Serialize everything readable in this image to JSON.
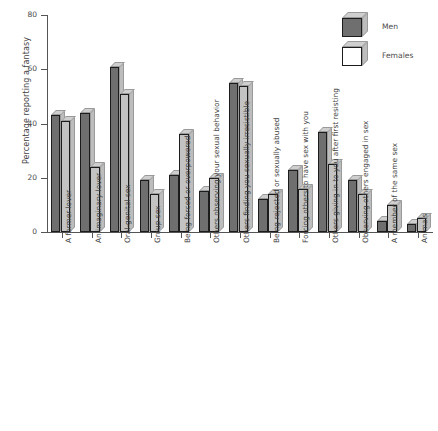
{
  "chart_data": {
    "type": "bar",
    "title": "",
    "xlabel": "",
    "ylabel": "Percentage reporting a fantasy",
    "ylim": [
      0,
      80
    ],
    "yticks": [
      0,
      20,
      40,
      60,
      80
    ],
    "grid": false,
    "legend_position": "top-right",
    "categories": [
      "A former lover",
      "An imaginary lover",
      "Oral-genital sex",
      "Group sex",
      "Being forced or overpowered",
      "Others observing your sexual behavior",
      "Others finding you sexually irresistible",
      "Being rejected or sexually abused",
      "Forcing others to have sex with you",
      "Others giving in to you after first resisting",
      "Observing others engaged in sex",
      "A member of the same sex",
      "Animals"
    ],
    "series": [
      {
        "name": "Men",
        "color": "#6f6f6f",
        "values": [
          43,
          44,
          61,
          19,
          21,
          15,
          55,
          12,
          23,
          37,
          19,
          4,
          3
        ]
      },
      {
        "name": "Females",
        "color": "#c3c3c3",
        "values": [
          41,
          24,
          51,
          14,
          36,
          20,
          54,
          14,
          16,
          25,
          14,
          10,
          5
        ]
      }
    ]
  },
  "legend": {
    "items": [
      {
        "label": "Men"
      },
      {
        "label": "Females"
      }
    ]
  },
  "axis": {
    "y_label": "Percentage reporting a fantasy",
    "y_tick_labels": [
      "0",
      "20",
      "40",
      "60",
      "80"
    ]
  }
}
